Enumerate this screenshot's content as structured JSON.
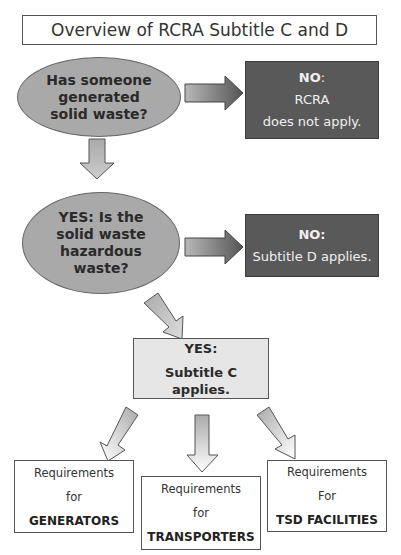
{
  "title": "Overview of RCRA Subtitle C and D",
  "question1": {
    "lines": [
      "Has someone",
      "generated",
      "solid waste?"
    ]
  },
  "no1": {
    "label": "NO",
    "suffix": ":",
    "lines": [
      "RCRA",
      "does not apply."
    ]
  },
  "question2": {
    "lines": [
      "YES: Is the",
      "solid waste",
      "hazardous",
      "waste?"
    ]
  },
  "no2": {
    "label": "NO:",
    "lines": [
      "Subtitle D applies."
    ]
  },
  "yes_c": {
    "label": "YES:",
    "lines": [
      "Subtitle C",
      "applies."
    ]
  },
  "requirements": [
    {
      "line1": "Requirements",
      "line2": "for",
      "line3": "GENERATORS"
    },
    {
      "line1": "Requirements",
      "line2": "for",
      "line3": "TRANSPORTERS"
    },
    {
      "line1": "Requirements",
      "line2": "For",
      "line3": "TSD FACILITIES"
    }
  ],
  "colors": {
    "ellipse_fill": "#a9a9a9",
    "dark_box_fill": "#595959",
    "light_box_fill": "#e6e6e6",
    "arrow_fill": "#c8c8c8"
  }
}
